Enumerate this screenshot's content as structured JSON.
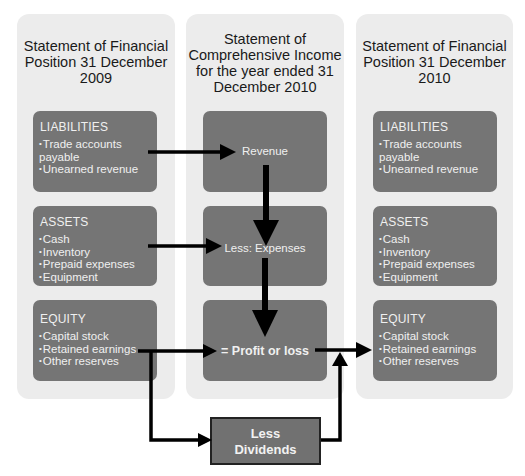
{
  "columns": [
    {
      "title": "Statement of Financial\nPosition 31 December\n2009",
      "boxes": [
        {
          "heading": "LIABILITIES",
          "items": [
            "Trade accounts payable",
            "Unearned revenue"
          ]
        },
        {
          "heading": "ASSETS",
          "items": [
            "Cash",
            "Inventory",
            "Prepaid expenses",
            "Equipment"
          ]
        },
        {
          "heading": "EQUITY",
          "items": [
            "Capital stock",
            "Retained earnings",
            "Other reserves"
          ]
        }
      ]
    },
    {
      "title": "Statement of\nComprehensive Income\nfor the year ended 31\nDecember 2010",
      "boxes": [
        {
          "label": "Revenue"
        },
        {
          "label": "Less: Expenses"
        },
        {
          "label": "= Profit or loss"
        }
      ]
    },
    {
      "title": "Statement of Financial\nPosition 31 December\n2010",
      "boxes": [
        {
          "heading": "LIABILITIES",
          "items": [
            "Trade accounts payable",
            "Unearned revenue"
          ]
        },
        {
          "heading": "ASSETS",
          "items": [
            "Cash",
            "Inventory",
            "Prepaid expenses",
            "Equipment"
          ]
        },
        {
          "heading": "EQUITY",
          "items": [
            "Capital stock",
            "Retained earnings",
            "Other reserves"
          ]
        }
      ]
    }
  ],
  "dividends": {
    "label": "Less\nDividends"
  },
  "colors": {
    "panel": "#ececec",
    "box": "#757575",
    "arrow": "#000000",
    "box_text": "#f0f0f0"
  }
}
